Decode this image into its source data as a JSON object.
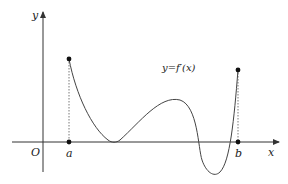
{
  "diagram": {
    "type": "function-graph",
    "function_label": "y=f′(x)",
    "axes": {
      "x_label": "x",
      "y_label": "y",
      "origin_label": "O"
    },
    "points": [
      {
        "label": "a",
        "x": 69
      },
      {
        "label": "b",
        "x": 238
      }
    ],
    "colors": {
      "axis": "#333333",
      "curve": "#444444",
      "dashed": "#555555"
    }
  }
}
